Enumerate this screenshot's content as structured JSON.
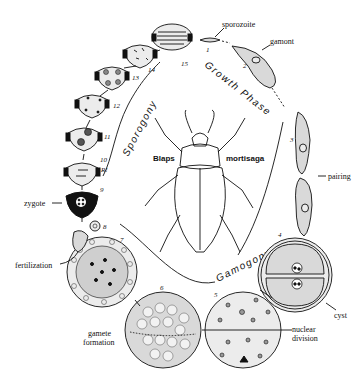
{
  "diagram": {
    "host": {
      "genus": "Blaps",
      "species": "mortisaga"
    },
    "phases": [
      {
        "id": "growth",
        "label": "Growth Phase"
      },
      {
        "id": "gamogony",
        "label": "Gamogony"
      },
      {
        "id": "sporogony",
        "label": "Sporogony"
      }
    ],
    "labels": {
      "sporozoite": "sporozoite",
      "gamont": "gamont",
      "pairing": "pairing",
      "cyst": "cyst",
      "nuclear_division": "nuclear division",
      "gamete_formation": "gamete formation",
      "fertilization": "fertilization",
      "zygote": "zygote",
      "reduction": "R!"
    },
    "stages": [
      {
        "n": "1",
        "name": "sporozoite"
      },
      {
        "n": "2",
        "name": "gamont"
      },
      {
        "n": "3",
        "name": "pairing"
      },
      {
        "n": "4",
        "name": "cyst"
      },
      {
        "n": "5",
        "name": "nuclear division"
      },
      {
        "n": "6",
        "name": "gamete formation"
      },
      {
        "n": "7",
        "name": "gametes"
      },
      {
        "n": "8",
        "name": "fertilization"
      },
      {
        "n": "9",
        "name": "zygote"
      },
      {
        "n": "10",
        "name": "oocyst"
      },
      {
        "n": "11",
        "name": "oocyst"
      },
      {
        "n": "12",
        "name": "oocyst"
      },
      {
        "n": "13",
        "name": "oocyst"
      },
      {
        "n": "14",
        "name": "oocyst"
      },
      {
        "n": "15",
        "name": "oocyst with sporozoites"
      }
    ]
  }
}
